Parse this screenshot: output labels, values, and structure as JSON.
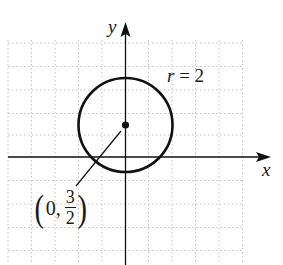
{
  "diagram": {
    "type": "circle-on-coordinate-plane",
    "axes": {
      "x_label": "x",
      "y_label": "y"
    },
    "circle": {
      "radius_label": "r = 2",
      "radius_symbol": "r",
      "radius_eq": "= 2",
      "center": {
        "x": 0,
        "y": 1.5
      },
      "radius": 2
    },
    "center_label": {
      "open": "(",
      "x": "0,",
      "numerator": "3",
      "denominator": "2",
      "close": ")"
    },
    "grid": {
      "spacing_units": 1,
      "style": "dotted",
      "color": "#bdbdbd"
    },
    "colors": {
      "stroke": "#111111",
      "grid": "#bdbdbd"
    }
  }
}
